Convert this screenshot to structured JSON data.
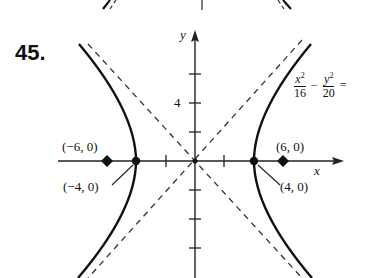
{
  "problem": {
    "number": "45."
  },
  "equation": {
    "term1_num": "x",
    "term1_exp": "2",
    "term1_den": "16",
    "operator": "−",
    "term2_num": "y",
    "term2_exp": "2",
    "term2_den": "20",
    "equals": "="
  },
  "axes": {
    "x_label": "x",
    "y_label": "y",
    "y_tick_label": "4"
  },
  "points": [
    {
      "label": "(−6, 0)",
      "role": "focus-left"
    },
    {
      "label": "(−4, 0)",
      "role": "vertex-left"
    },
    {
      "label": "(4, 0)",
      "role": "vertex-right"
    },
    {
      "label": "(6, 0)",
      "role": "focus-right"
    }
  ],
  "style": {
    "curve_color": "#111111",
    "asymptote_color": "#333333",
    "axis_color": "#222222"
  }
}
